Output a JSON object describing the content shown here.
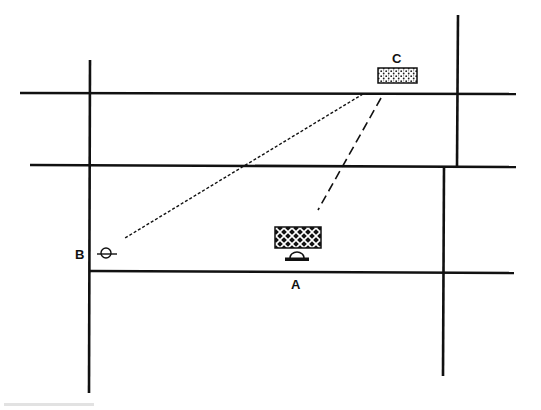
{
  "diagram": {
    "type": "street-map-sketch",
    "colors": {
      "line": "#111111",
      "background": "#ffffff"
    },
    "labels": {
      "a": "A",
      "b": "B",
      "c": "C"
    },
    "roads": {
      "horizontal": [
        {
          "name": "road-h1",
          "x1": 20,
          "y1": 93,
          "x2": 516,
          "y2": 94
        },
        {
          "name": "road-h2",
          "x1": 30,
          "y1": 165,
          "x2": 516,
          "y2": 167
        },
        {
          "name": "road-h3",
          "x1": 90,
          "y1": 271,
          "x2": 514,
          "y2": 273
        }
      ],
      "vertical": [
        {
          "name": "road-v-left",
          "x1": 90,
          "y1": 60,
          "x2": 89,
          "y2": 393
        },
        {
          "name": "road-v-right-upper",
          "x1": 458,
          "y1": 15,
          "x2": 457,
          "y2": 166
        },
        {
          "name": "road-v-right-lower",
          "x1": 444,
          "y1": 167,
          "x2": 443,
          "y2": 376
        }
      ]
    },
    "sight_lines": [
      {
        "name": "sight-line-c-to-b",
        "style": "dotted",
        "x1": 363,
        "y1": 94,
        "x2": 125,
        "y2": 238
      },
      {
        "name": "sight-line-c-to-a",
        "style": "dashed",
        "x1": 381,
        "y1": 98,
        "x2": 318,
        "y2": 210
      }
    ],
    "buildings": {
      "a": {
        "pattern": "crosshatch-weave",
        "x": 275,
        "y": 227,
        "w": 46,
        "h": 21
      },
      "c": {
        "pattern": "stipple",
        "x": 378,
        "y": 68,
        "w": 39,
        "h": 15
      }
    },
    "markers": {
      "a": {
        "icon": "observer-marker",
        "cx": 297,
        "cy": 256
      },
      "b": {
        "icon": "observer-marker",
        "cx": 106,
        "cy": 254
      }
    }
  }
}
